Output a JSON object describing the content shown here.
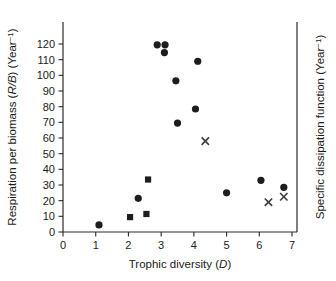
{
  "chart_data": {
    "type": "scatter",
    "title": "",
    "xlabel": "Trophic diversity (D)",
    "ylabel": "Respiration per biomass (R/B) (Year-1)",
    "y2label": "Specific dissipation function (Year-1)",
    "xlim": [
      0,
      7.5
    ],
    "ylim": [
      0,
      128
    ],
    "xticks": [
      0,
      1,
      2,
      3,
      4,
      5,
      6,
      7
    ],
    "xtick_labels": [
      "0",
      "1",
      "2",
      "3",
      "4",
      "5",
      "6",
      "7"
    ],
    "yticks": [
      0,
      10,
      20,
      30,
      40,
      50,
      60,
      70,
      80,
      90,
      100,
      110,
      120
    ],
    "ytick_labels": [
      "0",
      "10",
      "20",
      "30",
      "40",
      "50",
      "60",
      "70",
      "80",
      "90",
      "100",
      "110",
      "120"
    ],
    "y2ticks": [],
    "y2tick_labels": [],
    "grid": false,
    "legend": "none",
    "series": [
      {
        "name": "Respiration per biomass (filled circle)",
        "marker": "circle",
        "color": "#1d1d1d",
        "points": [
          {
            "x": 1.1,
            "y": 4.5
          },
          {
            "x": 2.3,
            "y": 21.5
          },
          {
            "x": 2.88,
            "y": 119.5
          },
          {
            "x": 3.12,
            "y": 119.5
          },
          {
            "x": 3.1,
            "y": 114.5
          },
          {
            "x": 3.45,
            "y": 96.5
          },
          {
            "x": 3.5,
            "y": 69.5
          },
          {
            "x": 4.05,
            "y": 78.5
          },
          {
            "x": 4.12,
            "y": 109.0
          },
          {
            "x": 5.0,
            "y": 25.0
          },
          {
            "x": 6.05,
            "y": 33.0
          },
          {
            "x": 6.75,
            "y": 28.5
          }
        ]
      },
      {
        "name": "Respiration per biomass (filled square)",
        "marker": "square",
        "color": "#1d1d1d",
        "points": [
          {
            "x": 2.05,
            "y": 9.5
          },
          {
            "x": 2.55,
            "y": 11.5
          },
          {
            "x": 2.6,
            "y": 33.5
          }
        ]
      },
      {
        "name": "Specific dissipation function (cross)",
        "marker": "cross",
        "color": "#3a3a3a",
        "points": [
          {
            "x": 4.35,
            "y": 58.0
          },
          {
            "x": 6.28,
            "y": 19.0
          },
          {
            "x": 6.75,
            "y": 22.5
          }
        ]
      }
    ]
  },
  "labels": {
    "x_axis_title_main": "Trophic diversity (",
    "x_axis_title_italic": "D",
    "x_axis_title_end": ")",
    "y_axis_title_a": "Respiration per biomass (",
    "y_axis_title_italic": "R/B",
    "y_axis_title_b": ") (Year",
    "y_axis_title_sup": "−1",
    "y_axis_title_c": ")",
    "y2_axis_title_a": "Specific dissipation function (Year",
    "y2_axis_title_sup": "−1",
    "y2_axis_title_b": ")"
  }
}
